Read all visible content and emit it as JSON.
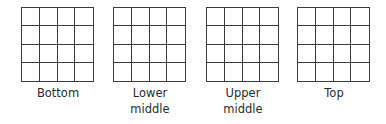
{
  "diagram": {
    "grid_rows": 4,
    "grid_cols": 4,
    "line_color": "#3a3a3a",
    "panels": [
      {
        "label_lines": [
          "Bottom"
        ]
      },
      {
        "label_lines": [
          "Lower",
          "middle"
        ]
      },
      {
        "label_lines": [
          "Upper",
          "middle"
        ]
      },
      {
        "label_lines": [
          "Top"
        ]
      }
    ]
  }
}
